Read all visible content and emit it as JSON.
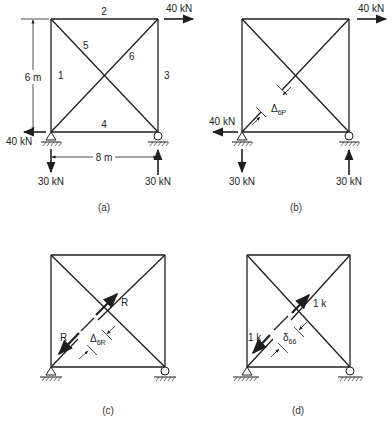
{
  "figure": {
    "panels": [
      {
        "id": "a",
        "caption": "(a)",
        "member_labels": [
          "1",
          "2",
          "3",
          "4",
          "5",
          "6"
        ],
        "dimensions": {
          "height": "6 m",
          "width": "8 m"
        },
        "loads": {
          "top_right_horizontal": "40 kN",
          "left_support_horizontal": "40 kN",
          "left_support_vertical": "30 kN",
          "right_support_vertical": "30 kN"
        }
      },
      {
        "id": "b",
        "caption": "(b)",
        "loads": {
          "top_right_horizontal": "40 kN",
          "left_support_horizontal": "40 kN",
          "left_support_vertical": "30 kN",
          "right_support_vertical": "30 kN"
        },
        "gap_label": {
          "symbol": "Δ",
          "subscript": "6P"
        }
      },
      {
        "id": "c",
        "caption": "(c)",
        "force_labels": {
          "upper": "R",
          "lower": "R"
        },
        "gap_label": {
          "symbol": "Δ",
          "subscript": "6R"
        }
      },
      {
        "id": "d",
        "caption": "(d)",
        "force_labels": {
          "upper": "1 k",
          "lower": "1 k"
        },
        "gap_label": {
          "symbol": "δ",
          "subscript": "66"
        }
      }
    ]
  }
}
